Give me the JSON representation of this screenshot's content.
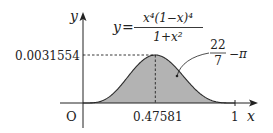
{
  "chart_data": {
    "type": "area",
    "title": "",
    "function_label": {
      "lhs": "y",
      "equals": "=",
      "numerator": "x⁴(1−x)⁴",
      "denominator": "1+x²"
    },
    "xlabel": "x",
    "ylabel": "y",
    "origin_label": "O",
    "x_ticks": [
      {
        "value": 0.47581,
        "label": "0.47581"
      },
      {
        "value": 1,
        "label": "1"
      }
    ],
    "y_ticks": [
      {
        "value": 0.0031554,
        "label": "0.0031554"
      }
    ],
    "peak": {
      "x": 0.47581,
      "y": 0.0031554
    },
    "xlim": [
      0,
      1
    ],
    "ylim": [
      0,
      0.0031554
    ],
    "area_annotation": {
      "numerator": "22",
      "denominator": "7",
      "suffix": "−π"
    },
    "shaded_region": "area under curve from x=0 to x=1",
    "grid": false,
    "legend": null,
    "series": [
      {
        "name": "x^4(1-x)^4/(1+x^2)",
        "x": [
          0,
          0.1,
          0.2,
          0.3,
          0.4,
          0.47581,
          0.5,
          0.6,
          0.7,
          0.8,
          0.9,
          1
        ],
        "values": [
          0,
          6.5e-05,
          0.0010125,
          0.0017946,
          0.0028676,
          0.0031554,
          0.003125,
          0.0025353,
          0.0013018,
          0.0003902,
          3.65e-05,
          0
        ]
      }
    ],
    "colors": {
      "fill": "#b3b3b3",
      "stroke": "#2b2b2b",
      "axis": "#222222",
      "guide": "#222222"
    }
  }
}
